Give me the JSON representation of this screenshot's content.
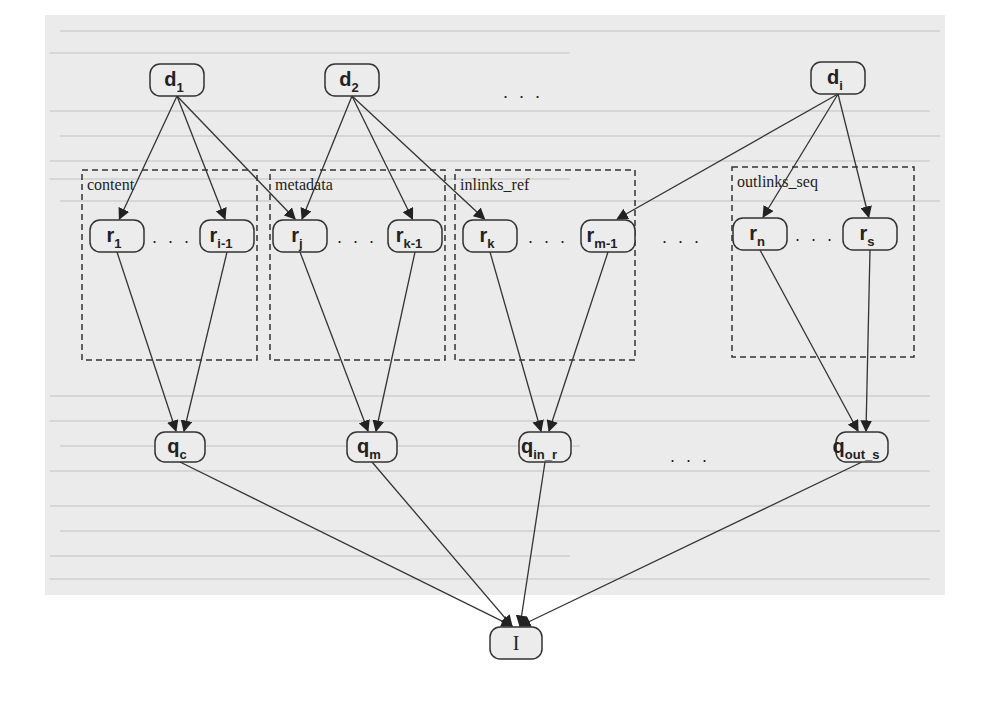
{
  "figure": {
    "type": "Bayesian inference network diagram",
    "document_nodes": [
      {
        "id": "d1",
        "base": "d",
        "sub": "1",
        "x": 177,
        "y": 80
      },
      {
        "id": "d2",
        "base": "d",
        "sub": "2",
        "x": 352,
        "y": 80
      },
      {
        "id": "di",
        "base": "d",
        "sub": "i",
        "x": 838,
        "y": 78
      }
    ],
    "document_ellipsis": {
      "text": "…",
      "x": 523,
      "y": 98
    },
    "groups": [
      {
        "id": "content",
        "label": "content",
        "x": 82,
        "y": 170,
        "w": 175,
        "h": 190
      },
      {
        "id": "metadata",
        "label": "metadata",
        "x": 270,
        "y": 170,
        "w": 175,
        "h": 190
      },
      {
        "id": "inlinks_ref",
        "label": "inlinks_ref",
        "x": 455,
        "y": 170,
        "w": 180,
        "h": 190
      },
      {
        "id": "outlinks_seq",
        "label": "outlinks_seq",
        "x": 732,
        "y": 167,
        "w": 182,
        "h": 190
      }
    ],
    "representation_nodes": [
      {
        "id": "r1",
        "base": "r",
        "sub": "1",
        "x": 117,
        "y": 236,
        "group": "content"
      },
      {
        "id": "ri-1",
        "base": "r",
        "sub": "i-1",
        "x": 227,
        "y": 236,
        "group": "content"
      },
      {
        "id": "rj",
        "base": "r",
        "sub": "j",
        "x": 300,
        "y": 236,
        "group": "metadata"
      },
      {
        "id": "rk-1",
        "base": "r",
        "sub": "k-1",
        "x": 415,
        "y": 236,
        "group": "metadata"
      },
      {
        "id": "rk",
        "base": "r",
        "sub": "k",
        "x": 490,
        "y": 236,
        "group": "inlinks_ref"
      },
      {
        "id": "rm-1",
        "base": "r",
        "sub": "m-1",
        "x": 608,
        "y": 236,
        "group": "inlinks_ref"
      },
      {
        "id": "rn",
        "base": "r",
        "sub": "n",
        "x": 760,
        "y": 234,
        "group": "outlinks_seq"
      },
      {
        "id": "rs",
        "base": "r",
        "sub": "s",
        "x": 870,
        "y": 234,
        "group": "outlinks_seq"
      }
    ],
    "inner_ellipses": [
      {
        "text": "…",
        "x": 172,
        "y": 243
      },
      {
        "text": "…",
        "x": 357,
        "y": 243
      },
      {
        "text": "…",
        "x": 548,
        "y": 243
      },
      {
        "text": "…",
        "x": 682,
        "y": 243
      },
      {
        "text": "…",
        "x": 815,
        "y": 241
      }
    ],
    "query_nodes": [
      {
        "id": "qc",
        "base": "q",
        "sub": "c",
        "x": 180,
        "y": 447
      },
      {
        "id": "qm",
        "base": "q",
        "sub": "m",
        "x": 372,
        "y": 447
      },
      {
        "id": "qin_r",
        "base": "q",
        "sub": "in_r",
        "x": 545,
        "y": 447
      },
      {
        "id": "qout_s",
        "base": "q",
        "sub": "out_s",
        "x": 862,
        "y": 447
      }
    ],
    "query_ellipsis": {
      "text": "…",
      "x": 690,
      "y": 462
    },
    "information_node": {
      "id": "I",
      "label": "I",
      "x": 516,
      "y": 643
    },
    "edges": [
      [
        "d1",
        "r1"
      ],
      [
        "d1",
        "ri-1"
      ],
      [
        "d1",
        "rj"
      ],
      [
        "d2",
        "rj"
      ],
      [
        "d2",
        "rk-1"
      ],
      [
        "d2",
        "rk"
      ],
      [
        "di",
        "rm-1"
      ],
      [
        "di",
        "rn"
      ],
      [
        "di",
        "rs"
      ],
      [
        "r1",
        "qc"
      ],
      [
        "ri-1",
        "qc"
      ],
      [
        "rj",
        "qm"
      ],
      [
        "rk-1",
        "qm"
      ],
      [
        "rk",
        "qin_r"
      ],
      [
        "rm-1",
        "qin_r"
      ],
      [
        "rn",
        "qout_s"
      ],
      [
        "rs",
        "qout_s"
      ],
      [
        "qc",
        "I"
      ],
      [
        "qm",
        "I"
      ],
      [
        "qin_r",
        "I"
      ],
      [
        "qout_s",
        "I"
      ]
    ],
    "colors": {
      "background": "#ebebeb",
      "stroke": "#333333",
      "node_fill": "#ececec",
      "text": "#222222"
    }
  }
}
